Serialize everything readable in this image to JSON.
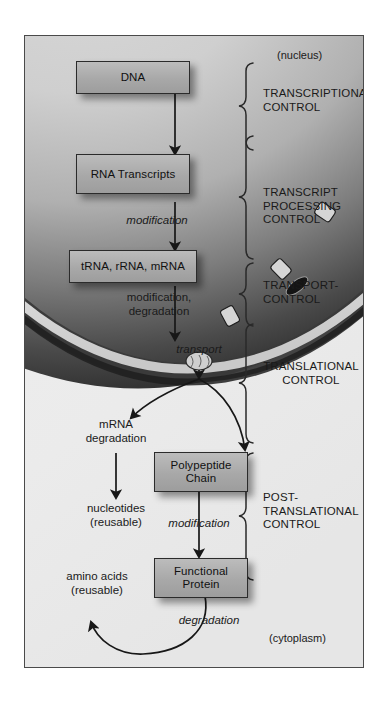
{
  "figure": {
    "compartments": {
      "nucleus": "(nucleus)",
      "cytoplasm": "(cytoplasm)"
    },
    "nodes": [
      {
        "id": "dna",
        "label": "DNA"
      },
      {
        "id": "rna_transcripts",
        "label": "RNA\nTranscripts"
      },
      {
        "id": "rnas",
        "label": "tRNA, rRNA, mRNA"
      },
      {
        "id": "polypeptide",
        "label": "Polypeptide\nChain"
      },
      {
        "id": "functional_protein",
        "label": "Functional\nProtein"
      }
    ],
    "process_labels": [
      {
        "id": "modification_rna",
        "text": "modification",
        "italic": true
      },
      {
        "id": "modification_degradation",
        "text": "modification,\ndegradation",
        "italic": false
      },
      {
        "id": "transport",
        "text": "transport",
        "italic": true
      },
      {
        "id": "mrna_degradation",
        "text": "mRNA\ndegradation",
        "italic": false
      },
      {
        "id": "nucleotides",
        "text": "nucleotides\n(reusable)",
        "italic": false
      },
      {
        "id": "modification_protein",
        "text": "modification",
        "italic": true
      },
      {
        "id": "amino_acids",
        "text": "amino acids\n(reusable)",
        "italic": false
      },
      {
        "id": "degradation_protein",
        "text": "degradation",
        "italic": true
      }
    ],
    "control_levels": [
      {
        "id": "transcriptional",
        "text": "TRANSCRIPTIONAL\nCONTROL"
      },
      {
        "id": "transcript_processing",
        "text": "TRANSCRIPT\nPROCESSING\nCONTROL"
      },
      {
        "id": "transport_control",
        "text": "TRANSPORT-\nCONTROL"
      },
      {
        "id": "translational",
        "text": "TRANSLATIONAL\nCONTROL"
      },
      {
        "id": "post_translational",
        "text": "POST-\nTRANSLATIONAL\nCONTROL"
      }
    ],
    "colors": {
      "box_fill": "#ababab",
      "box_stroke": "#2b2b2b",
      "frame_stroke": "#4a4a4a",
      "nucleus_dark": "#2a2a2a",
      "envelope_light": "#e8e8e8",
      "cytoplasm_bg": "#eeeeee",
      "arrow": "#171717",
      "text": "#1a1a1a"
    }
  }
}
